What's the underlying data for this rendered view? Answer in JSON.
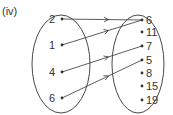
{
  "label": "(iv)",
  "domain_set": [
    "2",
    "1",
    "4",
    "6"
  ],
  "codomain_set": [
    "6",
    "11",
    "7",
    "5",
    "8",
    "15",
    "19"
  ],
  "mappings": [
    {
      "from": "2",
      "to": "6"
    },
    {
      "from": "1",
      "to": "6"
    },
    {
      "from": "4",
      "to": "7"
    },
    {
      "from": "6",
      "to": "5"
    }
  ],
  "colors": {
    "stroke": "#333333"
  }
}
